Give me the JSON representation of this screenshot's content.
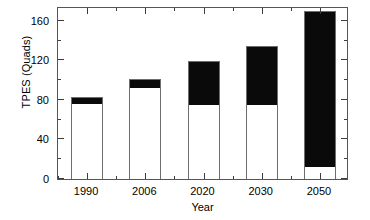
{
  "chart_data": {
    "type": "bar",
    "title": "",
    "subtitle": "",
    "xlabel": "Year",
    "ylabel": "TPES (Quads)",
    "categories": [
      "1990",
      "2006",
      "2020",
      "2030",
      "2050"
    ],
    "ylim": [
      0,
      175
    ],
    "xlim_note": "categorical, 5 evenly spaced bars",
    "grid": false,
    "legend": "none",
    "stacked": true,
    "y_ticks_major": [
      0,
      40,
      80,
      120,
      160
    ],
    "y_ticks_minor": [
      20,
      60,
      100,
      140
    ],
    "y_tick_labels": [
      "0",
      "40",
      "80",
      "120",
      "160"
    ],
    "series": [
      {
        "name": "white-segment",
        "color": "#ffffff",
        "values": [
          77,
          93,
          76,
          76,
          13
        ]
      },
      {
        "name": "black-segment",
        "color": "#000000",
        "values": [
          6,
          8,
          43,
          59,
          157
        ]
      }
    ],
    "totals": [
      83,
      101,
      119,
      135,
      170
    ],
    "annotations": []
  },
  "axes": {
    "y_title": "TPES (Quads)",
    "x_title": "Year"
  }
}
